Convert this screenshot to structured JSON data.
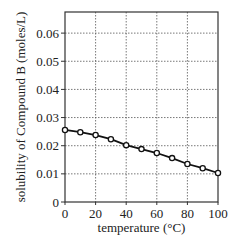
{
  "chart_data": {
    "type": "line",
    "title": "",
    "xlabel": "temperature (°C)",
    "ylabel": "solubility of Compound B (moles/L)",
    "x": [
      0,
      10,
      20,
      30,
      40,
      50,
      60,
      70,
      80,
      90,
      100
    ],
    "series": [
      {
        "name": "Compound B",
        "values": [
          0.0256,
          0.0248,
          0.0238,
          0.0223,
          0.0202,
          0.0188,
          0.0174,
          0.0156,
          0.0135,
          0.012,
          0.0103
        ],
        "marker": "open-circle",
        "color": "#111111"
      }
    ],
    "xlim": [
      0,
      100
    ],
    "ylim": [
      0,
      0.0675
    ],
    "xticks": [
      0,
      20,
      40,
      60,
      80,
      100
    ],
    "xtick_labels": [
      "0",
      "20",
      "40",
      "60",
      "80",
      "100"
    ],
    "yticks": [
      0,
      0.01,
      0.02,
      0.03,
      0.04,
      0.05,
      0.06
    ],
    "ytick_labels": [
      "0",
      "0.01",
      "0.02",
      "0.03",
      "0.04",
      "0.05",
      "0.06"
    ],
    "grid": true,
    "grid_style": "dotted",
    "legend": null
  }
}
